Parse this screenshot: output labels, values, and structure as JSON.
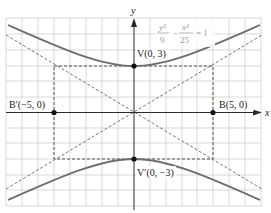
{
  "diagram": {
    "type": "hyperbola-graph",
    "equation": {
      "num1": "y²",
      "den1": "9",
      "minus": "−",
      "num2": "x²",
      "den2": "25",
      "equals": "= 1"
    },
    "axes": {
      "x_label": "x",
      "y_label": "y"
    },
    "points": [
      {
        "id": "V",
        "label": "V(0, 3)",
        "x": 0,
        "y": 3
      },
      {
        "id": "Vp",
        "label": "V′(0, −3)",
        "x": 0,
        "y": -3
      },
      {
        "id": "B",
        "label": "B(5, 0)",
        "x": 5,
        "y": 0
      },
      {
        "id": "Bp",
        "label": "B′(−5, 0)",
        "x": -5,
        "y": 0
      }
    ],
    "colors": {
      "grid": "#c8c8c8",
      "curve": "#6e6e6e",
      "axis": "#2a2a2a",
      "dashed": "#555555",
      "equation_text": "#9a9a9a",
      "label_text": "#222222"
    }
  }
}
